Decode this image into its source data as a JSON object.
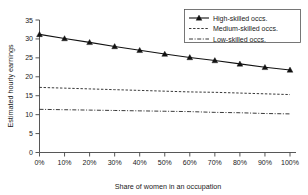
{
  "chart_data": {
    "type": "line",
    "title": "",
    "xlabel": "Share of women in an occupation",
    "ylabel": "Estimated hourly earnings",
    "x": [
      0,
      10,
      20,
      30,
      40,
      50,
      60,
      70,
      80,
      90,
      100
    ],
    "xticklabels": [
      "0%",
      "10%",
      "20%",
      "30%",
      "40%",
      "50%",
      "60%",
      "70%",
      "80%",
      "90%",
      "100%"
    ],
    "yticks": [
      0,
      5,
      10,
      15,
      20,
      25,
      30,
      35
    ],
    "yticklabels": [
      "0",
      "5",
      "10",
      "15",
      "20",
      "25",
      "30",
      "35"
    ],
    "xlim": [
      0,
      100
    ],
    "ylim": [
      0,
      35
    ],
    "grid": false,
    "legend_position": "top-right",
    "series": [
      {
        "name": "High-skilled occs.",
        "style": "solid",
        "marker": "triangle",
        "color": "#111111",
        "values": [
          31.2,
          30.1,
          29.1,
          28.0,
          27.0,
          26.0,
          25.1,
          24.3,
          23.4,
          22.5,
          21.8
        ]
      },
      {
        "name": "Medium-skilled occs.",
        "style": "dashed",
        "marker": "none",
        "color": "#222222",
        "values": [
          17.2,
          17.0,
          16.8,
          16.6,
          16.4,
          16.2,
          16.0,
          15.9,
          15.7,
          15.5,
          15.3
        ]
      },
      {
        "name": "Low-skilled occs.",
        "style": "dash-dot",
        "marker": "none",
        "color": "#222222",
        "values": [
          11.4,
          11.3,
          11.2,
          11.1,
          11.0,
          10.9,
          10.8,
          10.6,
          10.5,
          10.3,
          10.2
        ]
      }
    ]
  },
  "legend": {
    "entries": [
      {
        "label": "High-skilled occs."
      },
      {
        "label": "Medium-skilled occs."
      },
      {
        "label": "Low-skilled occs."
      }
    ]
  }
}
